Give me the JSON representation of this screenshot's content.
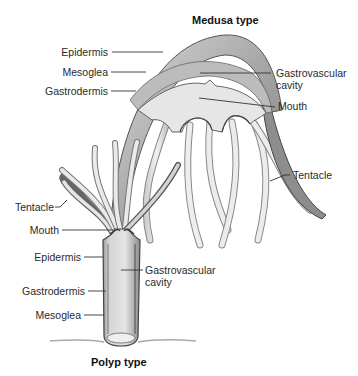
{
  "medusa": {
    "title": "Medusa type",
    "labels": {
      "epidermis": "Epidermis",
      "mesoglea": "Mesoglea",
      "gastrodermis": "Gastrodermis",
      "gastrovascular_line1": "Gastrovascular",
      "gastrovascular_line2": "cavity",
      "mouth": "Mouth",
      "tentacle": "Tentacle"
    }
  },
  "polyp": {
    "title": "Polyp type",
    "labels": {
      "tentacle": "Tentacle",
      "mouth": "Mouth",
      "epidermis": "Epidermis",
      "gastrodermis": "Gastrodermis",
      "mesoglea": "Mesoglea",
      "gastrovascular_line1": "Gastrovascular",
      "gastrovascular_line2": "cavity"
    }
  },
  "colors": {
    "outline": "#555555",
    "fill_light": "#e6e6e6",
    "fill_mid": "#c4c4c4",
    "fill_dark": "#8a8a8a",
    "leader": "#333333"
  }
}
